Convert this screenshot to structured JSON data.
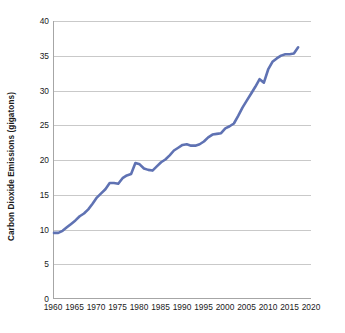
{
  "chart_data": {
    "type": "line",
    "title": "",
    "xlabel": "",
    "ylabel": "Carbon Dioxide Emissions (gigatons)",
    "xlim": [
      1960,
      2020
    ],
    "ylim": [
      0,
      40
    ],
    "xticks": [
      1960,
      1965,
      1970,
      1975,
      1980,
      1985,
      1990,
      1995,
      2000,
      2005,
      2010,
      2015,
      2020
    ],
    "yticks": [
      0,
      5,
      10,
      15,
      20,
      25,
      30,
      35,
      40
    ],
    "grid": "horizontal",
    "legend": "none",
    "line_color": "#5f72b3",
    "line_width": 2.6,
    "series": [
      {
        "name": "Carbon Dioxide Emissions",
        "x": [
          1960,
          1961,
          1962,
          1963,
          1964,
          1965,
          1966,
          1967,
          1968,
          1969,
          1970,
          1971,
          1972,
          1973,
          1974,
          1975,
          1976,
          1977,
          1978,
          1979,
          1980,
          1981,
          1982,
          1983,
          1984,
          1985,
          1986,
          1987,
          1988,
          1989,
          1990,
          1991,
          1992,
          1993,
          1994,
          1995,
          1996,
          1997,
          1998,
          1999,
          2000,
          2001,
          2002,
          2003,
          2004,
          2005,
          2006,
          2007,
          2008,
          2009,
          2010,
          2011,
          2012,
          2013,
          2014,
          2015,
          2016,
          2017
        ],
        "values": [
          9.4,
          9.4,
          9.7,
          10.2,
          10.7,
          11.2,
          11.8,
          12.2,
          12.8,
          13.6,
          14.5,
          15.1,
          15.7,
          16.6,
          16.6,
          16.5,
          17.3,
          17.7,
          17.9,
          19.5,
          19.3,
          18.7,
          18.5,
          18.4,
          19.0,
          19.6,
          20.0,
          20.6,
          21.3,
          21.7,
          22.1,
          22.2,
          22.0,
          22.0,
          22.2,
          22.6,
          23.2,
          23.6,
          23.7,
          23.8,
          24.5,
          24.8,
          25.2,
          26.3,
          27.5,
          28.5,
          29.5,
          30.5,
          31.6,
          31.1,
          33.0,
          34.1,
          34.6,
          35.0,
          35.2,
          35.2,
          35.3,
          36.2
        ]
      }
    ]
  }
}
